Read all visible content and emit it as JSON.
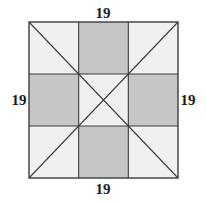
{
  "figure": {
    "title": "",
    "labels": {
      "top": "19",
      "right": "19",
      "bottom": "19",
      "left": "19"
    },
    "side_length": 19,
    "colors": {
      "stroke": "#3d3d3d",
      "shaded_cell": "#c6c6c6",
      "unshaded_cell": "#f0f0f0",
      "background": "#ffffff",
      "label_text": "#1a1a1a"
    },
    "geometry": {
      "square": {
        "x": 29,
        "y": 22,
        "width": 149,
        "height": 156
      },
      "grid_divisions": 3,
      "diagonals": [
        "top-left-to-bottom-right",
        "top-right-to-bottom-left"
      ]
    },
    "grid": {
      "rows": 3,
      "columns": 3,
      "shading": [
        [
          "light",
          "shaded",
          "light"
        ],
        [
          "shaded",
          "light",
          "shaded"
        ],
        [
          "light",
          "shaded",
          "light"
        ]
      ]
    }
  }
}
